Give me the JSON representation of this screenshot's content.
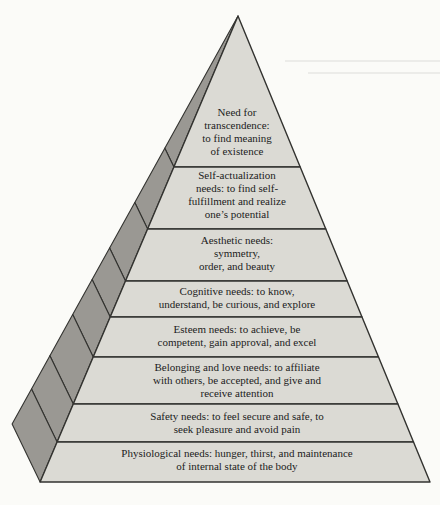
{
  "diagram": {
    "type": "pyramid",
    "levels": [
      {
        "id": "transcendence",
        "label": "Need for\ntranscendence:\nto find meaning\nof existence"
      },
      {
        "id": "self-actualization",
        "label": "Self-actualization\nneeds: to find self-\nfulfillment and realize\none’s potential"
      },
      {
        "id": "aesthetic",
        "label": "Aesthetic needs:\nsymmetry,\norder, and beauty"
      },
      {
        "id": "cognitive",
        "label": "Cognitive needs: to know,\nunderstand, be curious, and explore"
      },
      {
        "id": "esteem",
        "label": "Esteem needs: to achieve, be\ncompetent, gain approval, and excel"
      },
      {
        "id": "belonging-love",
        "label": "Belonging and love needs: to affiliate\nwith others, be accepted, and give and\nreceive attention"
      },
      {
        "id": "safety",
        "label": "Safety needs: to feel secure and safe, to\nseek pleasure and avoid pain"
      },
      {
        "id": "physiological",
        "label": "Physiological needs: hunger, thirst, and maintenance\nof internal state of the body"
      }
    ]
  },
  "colors": {
    "background": "#fbfbf8",
    "front_face": "#dbdad4",
    "side_face": "#9a9893",
    "outline": "#333330",
    "text": "#1c1c1c",
    "artifact_line": "#c9c9c5"
  }
}
